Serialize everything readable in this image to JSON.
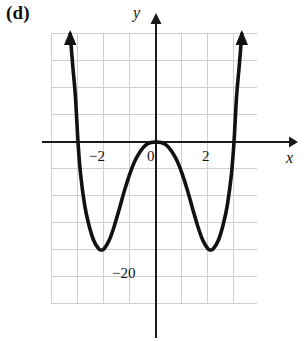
{
  "figure": {
    "panel_label": "(d)",
    "axis_labels": {
      "x": "x",
      "y": "y"
    }
  },
  "chart_data": {
    "type": "line",
    "title": "(d)",
    "xlabel": "x",
    "ylabel": "y",
    "grid": true,
    "legend": null,
    "xlim": [
      -4,
      4
    ],
    "ylim": [
      -30,
      20
    ],
    "x_ticks": [
      -2,
      0,
      2
    ],
    "x_tick_labels": [
      "−2",
      "0",
      "2"
    ],
    "y_ticks": [
      -20
    ],
    "y_tick_labels": [
      "−20"
    ],
    "gridline_spacing": {
      "x": 1,
      "y": 5
    },
    "curve_description": "Quartic polynomial, positive leading coefficient, W-shaped: rises to arrows on both ends, local maximum at (0, 0) touching the x-axis, two local minima near x = -2.1 and x = 2.1 at about y = -20, with x-intercepts near -3 and 3 and a double root at 0.",
    "annotations": [
      {
        "text": "−20",
        "x": -0.9,
        "y": -20
      }
    ],
    "series": [
      {
        "name": "quartic",
        "points": [
          {
            "x": -3.3,
            "y": 20.0
          },
          {
            "x": -3.2,
            "y": 14.0
          },
          {
            "x": -3.1,
            "y": 8.5
          },
          {
            "x": -3.0,
            "y": 0.0
          },
          {
            "x": -2.9,
            "y": -6.0
          },
          {
            "x": -2.75,
            "y": -11.5
          },
          {
            "x": -2.6,
            "y": -15.0
          },
          {
            "x": -2.4,
            "y": -18.2
          },
          {
            "x": -2.2,
            "y": -19.8
          },
          {
            "x": -2.1,
            "y": -20.0
          },
          {
            "x": -2.0,
            "y": -19.8
          },
          {
            "x": -1.8,
            "y": -18.2
          },
          {
            "x": -1.6,
            "y": -15.5
          },
          {
            "x": -1.4,
            "y": -12.2
          },
          {
            "x": -1.2,
            "y": -8.8
          },
          {
            "x": -1.0,
            "y": -5.8
          },
          {
            "x": -0.8,
            "y": -3.4
          },
          {
            "x": -0.6,
            "y": -1.7
          },
          {
            "x": -0.4,
            "y": -0.6
          },
          {
            "x": -0.2,
            "y": -0.1
          },
          {
            "x": 0.0,
            "y": 0.0
          },
          {
            "x": 0.2,
            "y": -0.1
          },
          {
            "x": 0.4,
            "y": -0.6
          },
          {
            "x": 0.6,
            "y": -1.7
          },
          {
            "x": 0.8,
            "y": -3.4
          },
          {
            "x": 1.0,
            "y": -5.8
          },
          {
            "x": 1.2,
            "y": -8.8
          },
          {
            "x": 1.4,
            "y": -12.2
          },
          {
            "x": 1.6,
            "y": -15.5
          },
          {
            "x": 1.8,
            "y": -18.2
          },
          {
            "x": 2.0,
            "y": -19.8
          },
          {
            "x": 2.1,
            "y": -20.0
          },
          {
            "x": 2.2,
            "y": -19.8
          },
          {
            "x": 2.4,
            "y": -18.2
          },
          {
            "x": 2.6,
            "y": -15.0
          },
          {
            "x": 2.75,
            "y": -11.5
          },
          {
            "x": 2.9,
            "y": -6.0
          },
          {
            "x": 3.0,
            "y": 0.0
          },
          {
            "x": 3.1,
            "y": 8.5
          },
          {
            "x": 3.2,
            "y": 14.0
          },
          {
            "x": 3.3,
            "y": 20.0
          }
        ],
        "end_arrows": [
          "up",
          "up"
        ]
      }
    ],
    "style": {
      "curve_color": "#111111",
      "axis_color": "#1a1a1a",
      "grid_color": "#cfcfcf",
      "background": "#ffffff"
    }
  },
  "geometry": {
    "plot_box": {
      "left": 51,
      "top": 33,
      "right": 257,
      "bottom": 304
    },
    "origin": {
      "x": 156,
      "y": 142
    },
    "unit_px": {
      "x": 26,
      "y": 27
    }
  }
}
